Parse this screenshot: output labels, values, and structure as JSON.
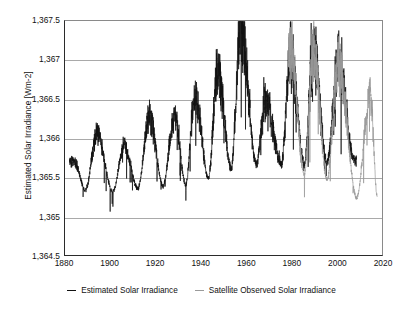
{
  "chart_data": {
    "type": "line",
    "title": "",
    "xlabel": "",
    "ylabel": "Estimated Solar Irradiance [Wm-2]",
    "xlim": [
      1880,
      2020
    ],
    "ylim": [
      1364.5,
      1367.5
    ],
    "xticks": [
      "1880",
      "1900",
      "1920",
      "1940",
      "1960",
      "1980",
      "2000",
      "2020"
    ],
    "xtick_values": [
      1880,
      1900,
      1920,
      1940,
      1960,
      1980,
      2000,
      2020
    ],
    "yticks": [
      "1,367.5",
      "1,367",
      "1,366.5",
      "1,366",
      "1,365.5",
      "1,365",
      "1,364.5"
    ],
    "ytick_values": [
      1367.5,
      1367,
      1366.5,
      1366,
      1365.5,
      1365,
      1364.5
    ],
    "grid": "horizontal",
    "legend_position": "bottom",
    "colors": {
      "estimated": "#111111",
      "satellite": "#9a9a9a",
      "grid": "#a9a9a9",
      "axis": "#2b2b2b"
    },
    "series": [
      {
        "name": "Estimated Solar Irradiance",
        "color": "#111111",
        "x_range": [
          1882,
          2008
        ],
        "cycle_period_years": 11,
        "cycle_peaks_x": [
          1884,
          1894,
          1906,
          1917,
          1928,
          1937,
          1947,
          1957,
          1968,
          1979,
          1989,
          2000
        ],
        "cycle_peaks_y": [
          1365.72,
          1366.06,
          1365.92,
          1366.28,
          1366.3,
          1366.55,
          1366.88,
          1367.47,
          1366.5,
          1367.12,
          1367.1,
          1367.0
        ],
        "cycle_mins_x": [
          1889,
          1901,
          1912,
          1923,
          1933,
          1943,
          1953,
          1964,
          1975,
          1985,
          1995,
          2007
        ],
        "cycle_mins_y": [
          1365.35,
          1365.33,
          1365.37,
          1365.4,
          1365.42,
          1365.5,
          1365.62,
          1365.68,
          1365.68,
          1365.68,
          1365.7,
          1365.72
        ],
        "noise_band_wm2": 0.22,
        "max_value": 1367.47,
        "max_year": 1957,
        "min_value": 1364.9,
        "min_year": 1882
      },
      {
        "name": "Satellite Observed Solar Irradiance",
        "color": "#9a9a9a",
        "x_range": [
          1978,
          2017
        ],
        "cycle_peaks_x": [
          1979,
          1989,
          2000,
          2014
        ],
        "cycle_peaks_y": [
          1367.14,
          1367.1,
          1366.98,
          1366.58
        ],
        "cycle_mins_x": [
          1985,
          1995,
          2008,
          2017
        ],
        "cycle_mins_y": [
          1365.55,
          1365.48,
          1365.25,
          1365.28
        ],
        "noise_band_wm2": 0.2,
        "max_value": 1367.14,
        "max_year": 1979,
        "min_value": 1365.2,
        "min_year": 2008
      }
    ],
    "legend": [
      {
        "label": "Estimated Solar Irradiance",
        "color": "#111111"
      },
      {
        "label": "Satellite Observed Solar Irradiance",
        "color": "#9a9a9a"
      }
    ]
  }
}
